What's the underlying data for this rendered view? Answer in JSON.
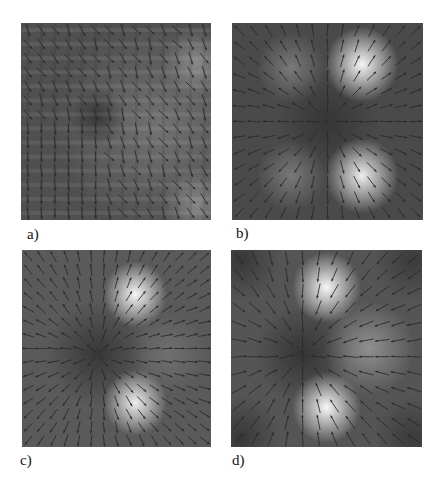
{
  "figure": {
    "panels": [
      {
        "id": "a",
        "label": "a)",
        "description": "noisy vector field over grid-artifact intensity map",
        "background": "#505050",
        "grid_artifacts": true,
        "blobs": [
          {
            "x": 0.45,
            "y": -0.05,
            "r": 0.9,
            "intensity": 0.25,
            "color": "#d8d8d8"
          },
          {
            "x": 0.85,
            "y": 0.6,
            "r": 0.3,
            "intensity": 0.35,
            "color": "#e0e0e0"
          },
          {
            "x": 0.85,
            "y": -0.85,
            "r": 0.3,
            "intensity": 0.35,
            "color": "#e0e0e0"
          },
          {
            "x": -0.2,
            "y": 0.05,
            "r": 0.25,
            "intensity": 0.6,
            "color": "#202020"
          }
        ],
        "field": {
          "type": "diagonal",
          "angle_deg": -60,
          "noise": 0.35,
          "grid": 14,
          "length": 0.6
        }
      },
      {
        "id": "b",
        "label": "b)",
        "description": "radial outward field from central dark sink with four bright lobes",
        "background": "#4a4a4a",
        "blobs": [
          {
            "x": 0.0,
            "y": 0.0,
            "r": 0.45,
            "intensity": 0.55,
            "color": "#252525"
          },
          {
            "x": 0.36,
            "y": 0.58,
            "r": 0.32,
            "intensity": 0.95,
            "color": "#ffffff"
          },
          {
            "x": 0.36,
            "y": -0.55,
            "r": 0.32,
            "intensity": 0.9,
            "color": "#ffffff"
          },
          {
            "x": -0.38,
            "y": 0.55,
            "r": 0.3,
            "intensity": 0.35,
            "color": "#d0d0d0"
          },
          {
            "x": -0.38,
            "y": -0.55,
            "r": 0.3,
            "intensity": 0.35,
            "color": "#d0d0d0"
          }
        ],
        "field": {
          "type": "radial",
          "center": [
            0.0,
            0.0
          ],
          "grid": 13,
          "length": 0.55
        }
      },
      {
        "id": "c",
        "label": "c)",
        "description": "radial outward field from off-center dark point with two bright lobes",
        "background": "#5a5a5a",
        "blobs": [
          {
            "x": -0.2,
            "y": -0.05,
            "r": 0.45,
            "intensity": 0.6,
            "color": "#202020"
          },
          {
            "x": 0.2,
            "y": 0.55,
            "r": 0.28,
            "intensity": 0.95,
            "color": "#ffffff"
          },
          {
            "x": 0.2,
            "y": -0.55,
            "r": 0.28,
            "intensity": 0.9,
            "color": "#ffffff"
          },
          {
            "x": 0.55,
            "y": -0.05,
            "r": 0.35,
            "intensity": 0.2,
            "color": "#c8c8c8"
          }
        ],
        "field": {
          "type": "radial",
          "center": [
            -0.2,
            -0.05
          ],
          "grid": 15,
          "length": 0.6
        }
      },
      {
        "id": "d",
        "label": "d)",
        "description": "field converging toward central dark point with bright lobes and dark corners",
        "background": "#555555",
        "blobs": [
          {
            "x": -0.25,
            "y": -0.05,
            "r": 0.42,
            "intensity": 0.6,
            "color": "#1e1e1e"
          },
          {
            "x": 0.0,
            "y": 0.62,
            "r": 0.3,
            "intensity": 0.95,
            "color": "#ffffff"
          },
          {
            "x": 0.0,
            "y": -0.6,
            "r": 0.3,
            "intensity": 0.95,
            "color": "#ffffff"
          },
          {
            "x": 0.45,
            "y": 0.0,
            "r": 0.4,
            "intensity": 0.45,
            "color": "#d8d8d8"
          },
          {
            "x": -0.9,
            "y": 0.9,
            "r": 0.35,
            "intensity": 0.5,
            "color": "#1a1a1a"
          },
          {
            "x": 0.9,
            "y": 0.9,
            "r": 0.35,
            "intensity": 0.45,
            "color": "#1a1a1a"
          },
          {
            "x": -0.9,
            "y": -0.9,
            "r": 0.35,
            "intensity": 0.5,
            "color": "#1a1a1a"
          },
          {
            "x": 0.9,
            "y": -0.9,
            "r": 0.35,
            "intensity": 0.45,
            "color": "#1a1a1a"
          }
        ],
        "field": {
          "type": "converging",
          "center": [
            -0.25,
            -0.05
          ],
          "grid": 12,
          "length": 0.6
        }
      }
    ],
    "arrow_color": "#2a2a2a"
  }
}
